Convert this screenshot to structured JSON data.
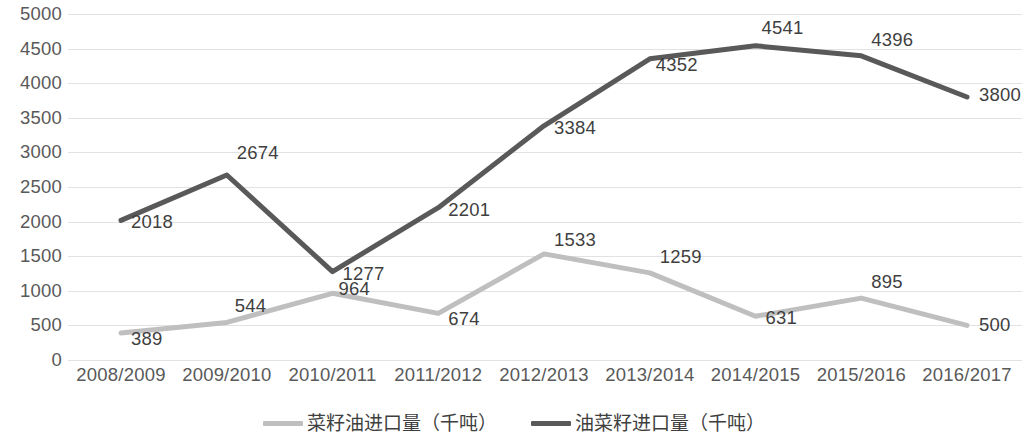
{
  "chart_data": {
    "type": "line",
    "title": "",
    "subtitle": "",
    "xlabel": "",
    "ylabel": "",
    "categories": [
      "2008/2009",
      "2009/2010",
      "2010/2011",
      "2011/2012",
      "2012/2013",
      "2013/2014",
      "2014/2015",
      "2015/2016",
      "2016/2017"
    ],
    "series": [
      {
        "name": "菜籽油进口量（千吨）",
        "color": "#bfbfbf",
        "values": [
          389,
          544,
          964,
          674,
          1533,
          1259,
          631,
          895,
          500
        ]
      },
      {
        "name": "油菜籽进口量（千吨）",
        "color": "#595959",
        "values": [
          2018,
          2674,
          1277,
          2201,
          3384,
          4352,
          4541,
          4396,
          3800
        ]
      }
    ],
    "ylim": [
      0,
      5000
    ],
    "yticks": [
      0,
      500,
      1000,
      1500,
      2000,
      2500,
      3000,
      3500,
      4000,
      4500,
      5000
    ],
    "ytick_labels": [
      "0",
      "500",
      "1000",
      "1500",
      "2000",
      "2500",
      "3000",
      "3500",
      "4000",
      "4500",
      "5000"
    ],
    "grid": true,
    "grid_color": "#e2e2e2",
    "legend_position": "bottom",
    "data_labels": true
  },
  "legend": {
    "items": [
      {
        "label": "菜籽油进口量（千吨）",
        "color": "#bfbfbf"
      },
      {
        "label": "油菜籽进口量（千吨）",
        "color": "#595959"
      }
    ]
  }
}
